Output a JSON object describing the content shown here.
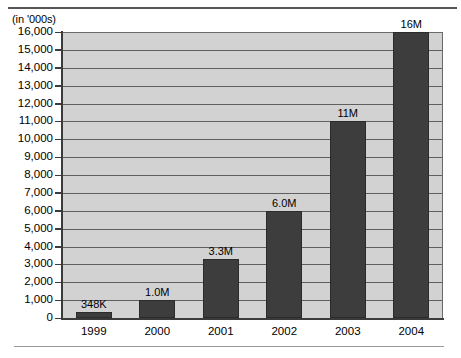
{
  "caption": {
    "units": "(in '000s)"
  },
  "chart_data": {
    "type": "bar",
    "title": "",
    "subtitle": "",
    "xlabel": "",
    "ylabel": "(in '000s)",
    "categories": [
      "1999",
      "2000",
      "2001",
      "2002",
      "2003",
      "2004"
    ],
    "values": [
      348,
      1000,
      3300,
      6000,
      11000,
      16000
    ],
    "data_labels": [
      "348K",
      "1.0M",
      "3.3M",
      "6.0M",
      "11M",
      "16M"
    ],
    "ylim": [
      0,
      16000
    ],
    "ytick_step": 1000,
    "ytick_labels": [
      "16,000",
      "15,000",
      "14,000",
      "13,000",
      "12,000",
      "11,000",
      "10,000",
      "9,000",
      "8,000",
      "7,000",
      "6,000",
      "5,000",
      "4,000",
      "3,000",
      "2,000",
      "1,000",
      "0"
    ],
    "grid": "horizontal",
    "legend": "none",
    "series": [
      {
        "name": "Units",
        "values": [
          348,
          1000,
          3300,
          6000,
          11000,
          16000
        ]
      }
    ],
    "colors": {
      "bar_fill": "#3d3d3d",
      "plot_background": "#d2d2d2",
      "gridline": "#5f5f5f",
      "axis": "#3b3b3b",
      "text": "#000000"
    }
  }
}
